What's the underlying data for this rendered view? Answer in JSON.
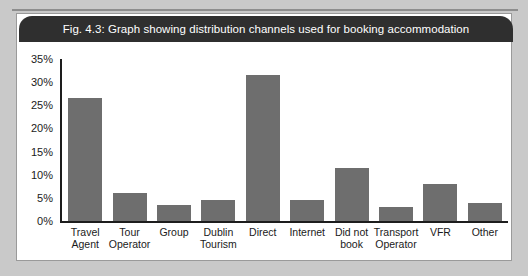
{
  "figure": {
    "caption": "Fig. 4.3: Graph showing distribution channels used for booking accommodation"
  },
  "colors": {
    "caption_bar": "#2f2f2f",
    "caption_text": "#ffffff",
    "bar_fill": "#6e6e6e",
    "axis": "#1d1d1d",
    "panel_background": "#ffffff",
    "page_background": "#c9c9c9"
  },
  "chart_data": {
    "type": "bar",
    "title": "Fig. 4.3: Graph showing distribution channels used for booking accommodation",
    "xlabel": "",
    "ylabel": "",
    "ylim": [
      0,
      35
    ],
    "grid": false,
    "legend": null,
    "y_ticks": [
      "0%",
      "5%",
      "10%",
      "15%",
      "20%",
      "25%",
      "30%",
      "35%"
    ],
    "y_tick_values": [
      0,
      5,
      10,
      15,
      20,
      25,
      30,
      35
    ],
    "categories": [
      "Travel Agent",
      "Tour Operator",
      "Group",
      "Dublin Tourism",
      "Direct",
      "Internet",
      "Did not book",
      "Transport Operator",
      "VFR",
      "Other"
    ],
    "category_lines": [
      [
        "Travel",
        "Agent"
      ],
      [
        "Tour",
        "Operator"
      ],
      [
        "Group",
        ""
      ],
      [
        "Dublin",
        "Tourism"
      ],
      [
        "Direct",
        ""
      ],
      [
        "Internet",
        ""
      ],
      [
        "Did not",
        "book"
      ],
      [
        "Transport",
        "Operator"
      ],
      [
        "VFR",
        ""
      ],
      [
        "Other",
        ""
      ]
    ],
    "values": [
      26.5,
      6,
      3.5,
      4.5,
      31.5,
      4.5,
      11.5,
      3,
      8,
      4
    ]
  }
}
